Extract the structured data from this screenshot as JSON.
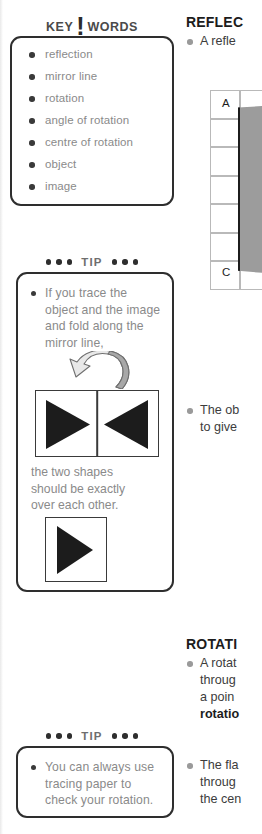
{
  "left_column": {
    "keywords_panel": {
      "header": {
        "word1": "KEY",
        "bang": "!",
        "word2": "WORDS"
      },
      "items": [
        "reflection",
        "mirror line",
        "rotation",
        "angle of rotation",
        "centre of rotation",
        "object",
        "image"
      ]
    },
    "tip_panel_1": {
      "header_label": "TIP",
      "bullet_lines": [
        "If you trace the",
        "object and the image",
        "and fold along the",
        "mirror line,"
      ],
      "caption_lines": [
        "the two shapes",
        "should be exactly",
        "over each other."
      ],
      "fold_arrow_name": "curved-fold-arrow",
      "mirror_panel": {
        "left_shape": "solid-triangle-pointing-right",
        "right_shape": "solid-triangle-pointing-left",
        "divider": "mirror-line"
      },
      "single_panel": {
        "shape": "solid-triangle-pointing-right"
      }
    },
    "tip_panel_2": {
      "header_label": "TIP",
      "bullet_lines": [
        "You can always use",
        "tracing paper to",
        "check your rotation."
      ]
    }
  },
  "right_column": {
    "reflection_heading": "REFLEC",
    "reflection_bullet_1": "A refle",
    "reflection_bullet_2_lines": [
      "The ob",
      "to give"
    ],
    "grid_diagram": {
      "vertex_a": "A",
      "vertex_c": "C",
      "rows": 7,
      "cols": 3,
      "shape": "shaded-polygon"
    },
    "rotation_heading": "ROTATI",
    "rotation_bullet_1_lines": [
      "A rotat",
      "throug",
      "a poin"
    ],
    "rotation_bullet_1_keyword": "rotatio",
    "rotation_bullet_2_lines": [
      "The fla",
      "throug",
      "the cen"
    ]
  },
  "colors": {
    "box_border": "#2e2e2e",
    "muted_text": "#8a8a8a",
    "body_text": "#3c3c3c",
    "shape_fill": "#1c1c1c",
    "shaded_gray": "#9c9c9c"
  }
}
